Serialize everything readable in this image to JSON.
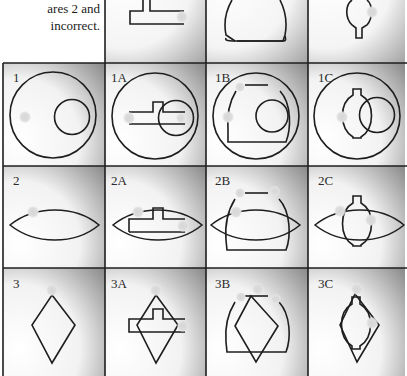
{
  "caption": {
    "lines": [
      "ares 2 and",
      "incorrect."
    ]
  },
  "grid": {
    "columns_x": [
      3,
      105,
      206,
      308,
      405
    ],
    "rows_y": [
      -40,
      63,
      166,
      268,
      376
    ],
    "stroke_color": "#1e1e1e",
    "cell_gradient_dark": "#9a9a9a",
    "cell_gradient_light": "#ffffff",
    "dot_color": "#d9d9d9",
    "shape_stroke": "#1e1e1e"
  },
  "cells": {
    "top_partial": [
      {
        "col": 1,
        "label": "",
        "shape": "t-bar"
      },
      {
        "col": 2,
        "label": "",
        "shape": "dome"
      },
      {
        "col": 3,
        "label": "",
        "shape": "keyhole"
      }
    ],
    "row1": [
      {
        "label": "1",
        "shape": "circle-with-small-circle"
      },
      {
        "label": "1A",
        "shape": "circle-with-t-bar"
      },
      {
        "label": "1B",
        "shape": "circle-with-dome"
      },
      {
        "label": "1C",
        "shape": "circle-with-keyhole"
      }
    ],
    "row2": [
      {
        "label": "2",
        "shape": "lens"
      },
      {
        "label": "2A",
        "shape": "lens-with-t-bar"
      },
      {
        "label": "2B",
        "shape": "lens-with-dome"
      },
      {
        "label": "2C",
        "shape": "lens-with-keyhole"
      }
    ],
    "row3": [
      {
        "label": "3",
        "shape": "diamond"
      },
      {
        "label": "3A",
        "shape": "diamond-with-t-bar"
      },
      {
        "label": "3B",
        "shape": "diamond-with-dome"
      },
      {
        "label": "3C",
        "shape": "diamond-with-keyhole"
      }
    ]
  }
}
